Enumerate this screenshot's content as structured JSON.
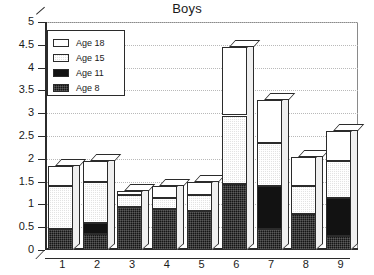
{
  "chart_data": {
    "type": "bar",
    "title": "Boys",
    "xlabel": "",
    "ylabel": "",
    "stacked": true,
    "grid": true,
    "legend_position": "top-left",
    "ylim": [
      0,
      5
    ],
    "categories": [
      "1",
      "2",
      "3",
      "4",
      "5",
      "6",
      "7",
      "8",
      "9"
    ],
    "ytick_labels": [
      "0",
      "0.5",
      "1",
      "1.5",
      "2",
      "2.5",
      "3",
      "3.5",
      "4",
      "4.5",
      "5"
    ],
    "ytick_values": [
      0,
      0.5,
      1,
      1.5,
      2,
      2.5,
      3,
      3.5,
      4,
      4.5,
      5
    ],
    "series": [
      {
        "name": "Age 8",
        "color": "#151515",
        "values": [
          0.45,
          0.35,
          0.95,
          0.9,
          0.85,
          1.45,
          0.45,
          0.8,
          0.3
        ]
      },
      {
        "name": "Age 11",
        "color": "#121212",
        "values": [
          0.0,
          0.25,
          0.0,
          0.0,
          0.0,
          0.0,
          0.95,
          0.0,
          0.85
        ]
      },
      {
        "name": "Age 15",
        "color": "#e3e3e3",
        "values": [
          0.95,
          0.9,
          0.25,
          0.25,
          0.35,
          1.5,
          0.95,
          0.6,
          0.8
        ]
      },
      {
        "name": "Age 18",
        "color": "#ffffff",
        "values": [
          0.45,
          0.45,
          0.1,
          0.25,
          0.3,
          1.5,
          0.95,
          0.65,
          0.65
        ]
      }
    ],
    "cumulative_tops": [
      {
        "category": "1",
        "age8": 0.45,
        "age11": 0.45,
        "age15": 1.4,
        "age18": 1.85
      },
      {
        "category": "2",
        "age8": 0.35,
        "age11": 0.6,
        "age15": 1.5,
        "age18": 1.95
      },
      {
        "category": "3",
        "age8": 0.95,
        "age11": 0.95,
        "age15": 1.2,
        "age18": 1.3
      },
      {
        "category": "4",
        "age8": 0.9,
        "age11": 0.9,
        "age15": 1.15,
        "age18": 1.4
      },
      {
        "category": "5",
        "age8": 0.85,
        "age11": 0.85,
        "age15": 1.2,
        "age18": 1.5
      },
      {
        "category": "6",
        "age8": 1.45,
        "age11": 1.45,
        "age15": 2.95,
        "age18": 4.45
      },
      {
        "category": "7",
        "age8": 0.45,
        "age11": 1.4,
        "age15": 2.35,
        "age18": 3.3
      },
      {
        "category": "8",
        "age8": 0.8,
        "age11": 0.8,
        "age15": 1.4,
        "age18": 2.05
      },
      {
        "category": "9",
        "age8": 0.3,
        "age11": 1.15,
        "age15": 1.95,
        "age18": 2.6
      }
    ],
    "totals": [
      1.85,
      1.95,
      1.3,
      1.4,
      1.5,
      4.45,
      3.3,
      2.05,
      2.6
    ]
  },
  "legend": {
    "items": [
      {
        "label": "Age 18",
        "swatch": "age18"
      },
      {
        "label": "Age 15",
        "swatch": "age15"
      },
      {
        "label": "Age 11",
        "swatch": "age11"
      },
      {
        "label": "Age 8",
        "swatch": "age8"
      }
    ]
  }
}
